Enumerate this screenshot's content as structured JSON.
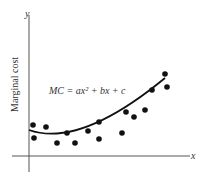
{
  "chart_data": {
    "type": "scatter",
    "title": "",
    "xlabel": "x",
    "ylabel": "Marginal cost",
    "y_axis_symbol": "y",
    "annotation": "MC = ax² + bx + c",
    "grid": false,
    "legend": "none",
    "points": [
      [
        33,
        125
      ],
      [
        34,
        138
      ],
      [
        46,
        127
      ],
      [
        57,
        143
      ],
      [
        67,
        133
      ],
      [
        75,
        143
      ],
      [
        88,
        131
      ],
      [
        99,
        122
      ],
      [
        99,
        139
      ],
      [
        122,
        133
      ],
      [
        126,
        112
      ],
      [
        134,
        117
      ],
      [
        145,
        110
      ],
      [
        152,
        90
      ],
      [
        165,
        74
      ],
      [
        167,
        87
      ]
    ],
    "fit_curve": "quadratic",
    "colors": {
      "ink": "#111111",
      "axis": "#555555"
    }
  }
}
